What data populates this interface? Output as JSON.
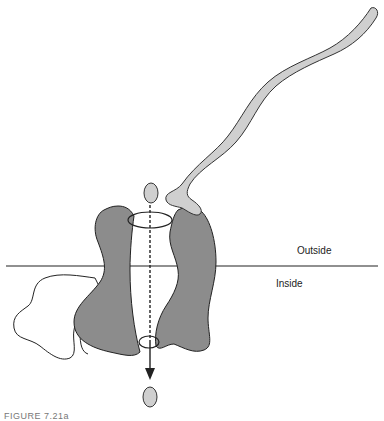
{
  "diagram": {
    "labels": {
      "outside": "Outside",
      "inside": "Inside"
    },
    "caption": "FIGURE 7.21a",
    "colors": {
      "channel_subunit": "#8c8c8c",
      "toxin_chain": "#cfcfcf",
      "ion": "#cfcfcf",
      "outline": "#222222",
      "membrane_line": "#222222"
    },
    "elements": [
      "membrane-line",
      "channel-left-subunit",
      "channel-right-subunit",
      "accessory-subunit",
      "toxin-peptide-chain",
      "ion-outside",
      "ion-inside",
      "pore-axis-arrow"
    ]
  }
}
